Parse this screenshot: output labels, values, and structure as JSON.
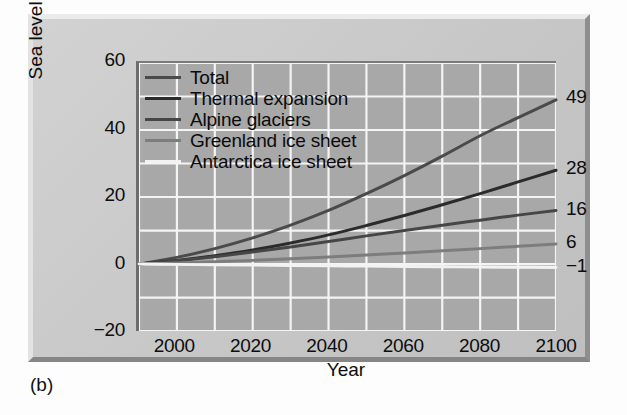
{
  "caption": "(b)",
  "chart_data": {
    "type": "line",
    "title": "",
    "xlabel": "Year",
    "ylabel": "Sea level change (cm)",
    "xlim": [
      1990,
      2100
    ],
    "ylim": [
      -20,
      60
    ],
    "xticks": [
      2000,
      2020,
      2040,
      2060,
      2080,
      2100
    ],
    "xtick_labels": [
      "2000",
      "2020",
      "2040",
      "2060",
      "2080",
      "2100"
    ],
    "yticks": [
      -20,
      0,
      20,
      40,
      60
    ],
    "ytick_labels": [
      "-20",
      "0",
      "20",
      "40",
      "60"
    ],
    "grid": true,
    "grid_x_step": 10,
    "grid_y_step": 10,
    "legend_position": "upper-left",
    "x": [
      1990,
      2000,
      2010,
      2020,
      2030,
      2040,
      2050,
      2060,
      2070,
      2080,
      2090,
      2100
    ],
    "series": [
      {
        "name": "Total",
        "color": "#4a4a4a",
        "end_label": "49",
        "end_value": 49,
        "values": [
          0,
          2.0,
          4.6,
          7.8,
          11.6,
          16.0,
          21.0,
          26.4,
          32.2,
          38.3,
          43.7,
          49.0
        ]
      },
      {
        "name": "Thermal expansion",
        "color": "#2b2b2b",
        "end_label": "28",
        "end_value": 28,
        "values": [
          0,
          1.1,
          2.5,
          4.2,
          6.3,
          8.7,
          11.5,
          14.5,
          17.7,
          21.0,
          24.5,
          28.0
        ]
      },
      {
        "name": "Alpine glaciers",
        "color": "#464646",
        "end_label": "16",
        "end_value": 16,
        "values": [
          0,
          1.0,
          2.2,
          3.6,
          5.1,
          6.7,
          8.4,
          10.0,
          11.6,
          13.1,
          14.6,
          16.0
        ]
      },
      {
        "name": "Greenland ice sheet",
        "color": "#7d7d7d",
        "end_label": "6",
        "end_value": 6,
        "values": [
          0,
          0.3,
          0.7,
          1.1,
          1.6,
          2.1,
          2.7,
          3.3,
          4.0,
          4.6,
          5.3,
          6.0
        ]
      },
      {
        "name": "Antarctica ice sheet",
        "color": "#f2f2f2",
        "end_label": "-1",
        "end_value": -1,
        "values": [
          0,
          -0.1,
          -0.2,
          -0.3,
          -0.4,
          -0.5,
          -0.6,
          -0.7,
          -0.8,
          -0.9,
          -0.95,
          -1.0
        ]
      }
    ]
  }
}
